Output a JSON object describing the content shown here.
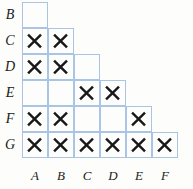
{
  "figure": {
    "type": "staircase-grid-matrix",
    "mark_glyph": "X",
    "row_labels": [
      "B",
      "C",
      "D",
      "E",
      "F",
      "G"
    ],
    "column_labels": [
      "A",
      "B",
      "C",
      "D",
      "E",
      "F"
    ],
    "colors": {
      "grid_line": "#a9c4e4",
      "mark": "#181818",
      "label": "#1a1a1a",
      "background": "#fdfdfb"
    },
    "geometry": {
      "cell_size": 26,
      "grid_origin_x": 22,
      "grid_origin_y": 2,
      "label_gutter_width": 20,
      "column_label_strip_y": 166
    },
    "rows": [
      {
        "label": "B",
        "cell_count": 1,
        "marks": []
      },
      {
        "label": "C",
        "cell_count": 2,
        "marks": [
          "A",
          "B"
        ]
      },
      {
        "label": "D",
        "cell_count": 3,
        "marks": [
          "A",
          "B"
        ]
      },
      {
        "label": "E",
        "cell_count": 4,
        "marks": [
          "C",
          "D"
        ]
      },
      {
        "label": "F",
        "cell_count": 5,
        "marks": [
          "A",
          "B",
          "E"
        ]
      },
      {
        "label": "G",
        "cell_count": 6,
        "marks": [
          "A",
          "B",
          "C",
          "D",
          "E",
          "F"
        ]
      }
    ]
  }
}
